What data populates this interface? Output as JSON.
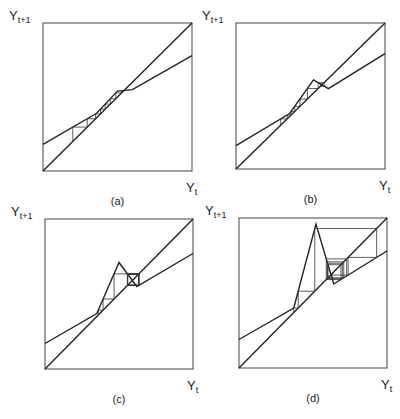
{
  "figure": {
    "y_axis_label": "Y",
    "y_axis_subscript": "t+1",
    "x_axis_label": "Y",
    "x_axis_subscript": "t",
    "panels": [
      {
        "id": "a",
        "caption": "(a)",
        "description": "Piecewise-linear map with 45-degree line; cobweb converges monotonically along steep segment",
        "map_points": [
          [
            0,
            0.18
          ],
          [
            0.36,
            0.39
          ],
          [
            0.5,
            0.54
          ],
          [
            0.6,
            0.55
          ],
          [
            1,
            0.78
          ]
        ],
        "cobweb_start_x": 0.2
      },
      {
        "id": "b",
        "caption": "(b)",
        "description": "Map with a small peak; cobweb oscillation near peak",
        "map_points": [
          [
            0,
            0.16
          ],
          [
            0.36,
            0.38
          ],
          [
            0.52,
            0.61
          ],
          [
            0.62,
            0.55
          ],
          [
            1,
            0.79
          ]
        ],
        "cobweb_start_x": 0.3
      },
      {
        "id": "c",
        "caption": "(c)",
        "description": "Map with a higher peak; cobweb cycles around fixed point",
        "map_points": [
          [
            0,
            0.17
          ],
          [
            0.35,
            0.37
          ],
          [
            0.5,
            0.71
          ],
          [
            0.62,
            0.55
          ],
          [
            1,
            0.77
          ]
        ],
        "cobweb_start_x": 0.36
      },
      {
        "id": "d",
        "caption": "(d)",
        "description": "Map with a tall peak; cobweb shows large oscillations",
        "map_points": [
          [
            0,
            0.19
          ],
          [
            0.37,
            0.4
          ],
          [
            0.52,
            0.96
          ],
          [
            0.64,
            0.56
          ],
          [
            1,
            0.78
          ]
        ],
        "cobweb_start_x": 0.37
      }
    ]
  }
}
